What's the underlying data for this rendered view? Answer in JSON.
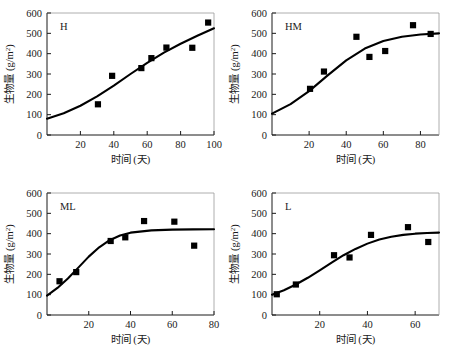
{
  "figure": {
    "layout": "2x2 grid of scatter plots with fitted sigmoid curves",
    "background": "#ffffff",
    "marker_color": "#000000",
    "curve_color": "#000000",
    "axis_color": "#1a1a1a"
  },
  "axis_titles": {
    "x": "时间 (天)",
    "y_main": "生物量",
    "y_unit_open": " (g/m",
    "y_unit_sup": "2",
    "y_unit_close": ")"
  },
  "chart_data": [
    {
      "type": "scatter",
      "title": "H",
      "xlabel": "时间 (天)",
      "ylabel": "生物量 (g/m2)",
      "xlim": [
        0,
        100
      ],
      "ylim": [
        0,
        600
      ],
      "xticks": [
        20,
        40,
        60,
        80,
        100
      ],
      "yticks": [
        0,
        100,
        200,
        300,
        400,
        500,
        600
      ],
      "grid": false,
      "legend": "none",
      "points": [
        {
          "x": 30.5,
          "y": 151
        },
        {
          "x": 39.0,
          "y": 291
        },
        {
          "x": 56.5,
          "y": 329
        },
        {
          "x": 62.5,
          "y": 378
        },
        {
          "x": 71.5,
          "y": 430
        },
        {
          "x": 87.0,
          "y": 429
        },
        {
          "x": 96.5,
          "y": 553
        }
      ],
      "curve": {
        "model": "logistic",
        "description": "fitted sigmoid rising from ~80 at day 0 to ~525 at day 100",
        "points": [
          {
            "x": 0,
            "y": 80
          },
          {
            "x": 10,
            "y": 107
          },
          {
            "x": 20,
            "y": 144
          },
          {
            "x": 30,
            "y": 190
          },
          {
            "x": 40,
            "y": 243
          },
          {
            "x": 50,
            "y": 300
          },
          {
            "x": 60,
            "y": 355
          },
          {
            "x": 70,
            "y": 405
          },
          {
            "x": 80,
            "y": 449
          },
          {
            "x": 90,
            "y": 488
          },
          {
            "x": 100,
            "y": 525
          }
        ]
      }
    },
    {
      "type": "scatter",
      "title": "HM",
      "xlabel": "时间 (天)",
      "ylabel": "生物量 (g/m2)",
      "xlim": [
        0,
        90
      ],
      "ylim": [
        0,
        600
      ],
      "xticks": [
        20,
        40,
        60,
        80
      ],
      "yticks": [
        0,
        100,
        200,
        300,
        400,
        500,
        600
      ],
      "grid": false,
      "legend": "none",
      "points": [
        {
          "x": 20.5,
          "y": 227
        },
        {
          "x": 28.0,
          "y": 312
        },
        {
          "x": 45.5,
          "y": 483
        },
        {
          "x": 52.5,
          "y": 384
        },
        {
          "x": 61.0,
          "y": 413
        },
        {
          "x": 76.0,
          "y": 540
        },
        {
          "x": 85.5,
          "y": 497
        }
      ],
      "curve": {
        "model": "logistic",
        "description": "fitted sigmoid rising from ~105 at day 0 plateauing near ~500 by day 90",
        "points": [
          {
            "x": 0,
            "y": 105
          },
          {
            "x": 10,
            "y": 152
          },
          {
            "x": 20,
            "y": 216
          },
          {
            "x": 30,
            "y": 293
          },
          {
            "x": 40,
            "y": 367
          },
          {
            "x": 50,
            "y": 425
          },
          {
            "x": 60,
            "y": 462
          },
          {
            "x": 70,
            "y": 483
          },
          {
            "x": 80,
            "y": 494
          },
          {
            "x": 90,
            "y": 500
          }
        ]
      }
    },
    {
      "type": "scatter",
      "title": "ML",
      "xlabel": "时间 (天)",
      "ylabel": "生物量 (g/m2)",
      "xlim": [
        0,
        80
      ],
      "ylim": [
        0,
        600
      ],
      "xticks": [
        20,
        40,
        60,
        80
      ],
      "yticks": [
        0,
        100,
        200,
        300,
        400,
        500,
        600
      ],
      "grid": false,
      "legend": "none",
      "points": [
        {
          "x": 6.0,
          "y": 166
        },
        {
          "x": 14.0,
          "y": 211
        },
        {
          "x": 30.5,
          "y": 364
        },
        {
          "x": 37.5,
          "y": 382
        },
        {
          "x": 46.5,
          "y": 462
        },
        {
          "x": 61.0,
          "y": 459
        },
        {
          "x": 70.5,
          "y": 341
        }
      ],
      "curve": {
        "model": "logistic",
        "description": "fitted sigmoid rising from ~95 at day 0 plateauing near ~420 after day 45",
        "points": [
          {
            "x": 0,
            "y": 95
          },
          {
            "x": 5,
            "y": 133
          },
          {
            "x": 10,
            "y": 180
          },
          {
            "x": 15,
            "y": 233
          },
          {
            "x": 20,
            "y": 287
          },
          {
            "x": 25,
            "y": 333
          },
          {
            "x": 30,
            "y": 368
          },
          {
            "x": 35,
            "y": 391
          },
          {
            "x": 40,
            "y": 405
          },
          {
            "x": 50,
            "y": 416
          },
          {
            "x": 60,
            "y": 420
          },
          {
            "x": 70,
            "y": 421
          },
          {
            "x": 80,
            "y": 422
          }
        ]
      }
    },
    {
      "type": "scatter",
      "title": "L",
      "xlabel": "时间 (天)",
      "ylabel": "生物量 (g/m2)",
      "xlim": [
        0,
        70
      ],
      "ylim": [
        0,
        600
      ],
      "xticks": [
        20,
        40,
        60
      ],
      "yticks": [
        0,
        100,
        200,
        300,
        400,
        500,
        600
      ],
      "grid": false,
      "legend": "none",
      "points": [
        {
          "x": 2.0,
          "y": 102
        },
        {
          "x": 10.0,
          "y": 150
        },
        {
          "x": 26.0,
          "y": 294
        },
        {
          "x": 32.5,
          "y": 283
        },
        {
          "x": 41.5,
          "y": 394
        },
        {
          "x": 57.0,
          "y": 432
        },
        {
          "x": 65.5,
          "y": 359
        }
      ],
      "curve": {
        "model": "logistic",
        "description": "fitted sigmoid rising from ~100 at day 0 toward ~405 at day 70",
        "points": [
          {
            "x": 0,
            "y": 100
          },
          {
            "x": 5,
            "y": 122
          },
          {
            "x": 10,
            "y": 150
          },
          {
            "x": 15,
            "y": 183
          },
          {
            "x": 20,
            "y": 220
          },
          {
            "x": 25,
            "y": 258
          },
          {
            "x": 30,
            "y": 294
          },
          {
            "x": 35,
            "y": 325
          },
          {
            "x": 40,
            "y": 351
          },
          {
            "x": 45,
            "y": 371
          },
          {
            "x": 50,
            "y": 385
          },
          {
            "x": 55,
            "y": 394
          },
          {
            "x": 60,
            "y": 400
          },
          {
            "x": 65,
            "y": 403
          },
          {
            "x": 70,
            "y": 405
          }
        ]
      }
    }
  ]
}
